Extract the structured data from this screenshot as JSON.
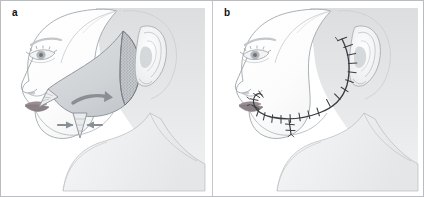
{
  "figure": {
    "kind": "medical-illustration",
    "panel_count": 2,
    "border_color": "#b9bcc0",
    "background_color": "#ffffff"
  },
  "palette": {
    "skin_outline": "#9aa0a6",
    "skin_fill": "#fdfdfd",
    "backdrop_gray": "#dcdee0",
    "flap_fill": "#d3d6d9",
    "flap_edge": "#8e9399",
    "stipple_fill": "#b4b8bc",
    "stipple_edge": "#6f747a",
    "arrow_gray": "#8a8f95",
    "lip_color": "#9b8f93",
    "suture_line": "#3a3d41",
    "hair_shadow": "#c9ccd0"
  },
  "panels": [
    {
      "id": "a",
      "label": "a",
      "title": "Flap design and undermining",
      "annotations": {
        "rotation_arrow": "curved rotation arrow under cheek flap",
        "advancement_arrows": "two opposing arrows at inferior dart",
        "stipple_region": "undermined subcutaneous plane at posterior flap margin",
        "nasolabial_triangle": "Burow's triangle at nasolabial fold",
        "inferior_dart": "standing cone excision dart"
      }
    },
    {
      "id": "b",
      "label": "b",
      "title": "Completed closure with sutures",
      "annotations": {
        "suture_line": "interrupted sutures along preauricular and cheek incision",
        "stitch_count": 22
      }
    }
  ]
}
